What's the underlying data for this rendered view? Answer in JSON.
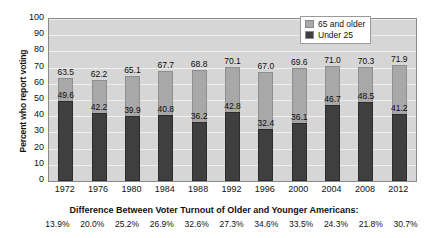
{
  "chart_data": {
    "type": "bar",
    "title": "",
    "xlabel": "",
    "ylabel": "Percent who report voting",
    "ylim": [
      0,
      100
    ],
    "ytick_step": 10,
    "grid": true,
    "legend_position": "top-right",
    "categories": [
      "1972",
      "1976",
      "1980",
      "1984",
      "1988",
      "1992",
      "1996",
      "2000",
      "2004",
      "2008",
      "2012"
    ],
    "series": [
      {
        "name": "65 and older",
        "color": "#a8a8a8",
        "values": [
          63.5,
          62.2,
          65.1,
          67.7,
          68.8,
          70.1,
          67.0,
          69.6,
          71.0,
          70.3,
          71.9
        ]
      },
      {
        "name": "Under 25",
        "color": "#3f3f3f",
        "values": [
          49.6,
          42.2,
          39.9,
          40.8,
          36.2,
          42.8,
          32.4,
          36.1,
          46.7,
          48.5,
          41.2
        ]
      }
    ],
    "yticks": [
      "0",
      "10",
      "20",
      "30",
      "40",
      "50",
      "60",
      "70",
      "80",
      "90",
      "100"
    ],
    "annotations": {
      "caption": "Difference Between Voter Turnout of Older and Younger Americans:",
      "differences": [
        "13.9%",
        "20.0%",
        "25.2%",
        "26.9%",
        "32.6%",
        "27.3%",
        "34.6%",
        "33.5%",
        "24.3%",
        "21.8%",
        "30.7%"
      ]
    }
  },
  "legend": {
    "items": [
      {
        "label": "65 and older"
      },
      {
        "label": "Under 25"
      }
    ]
  }
}
